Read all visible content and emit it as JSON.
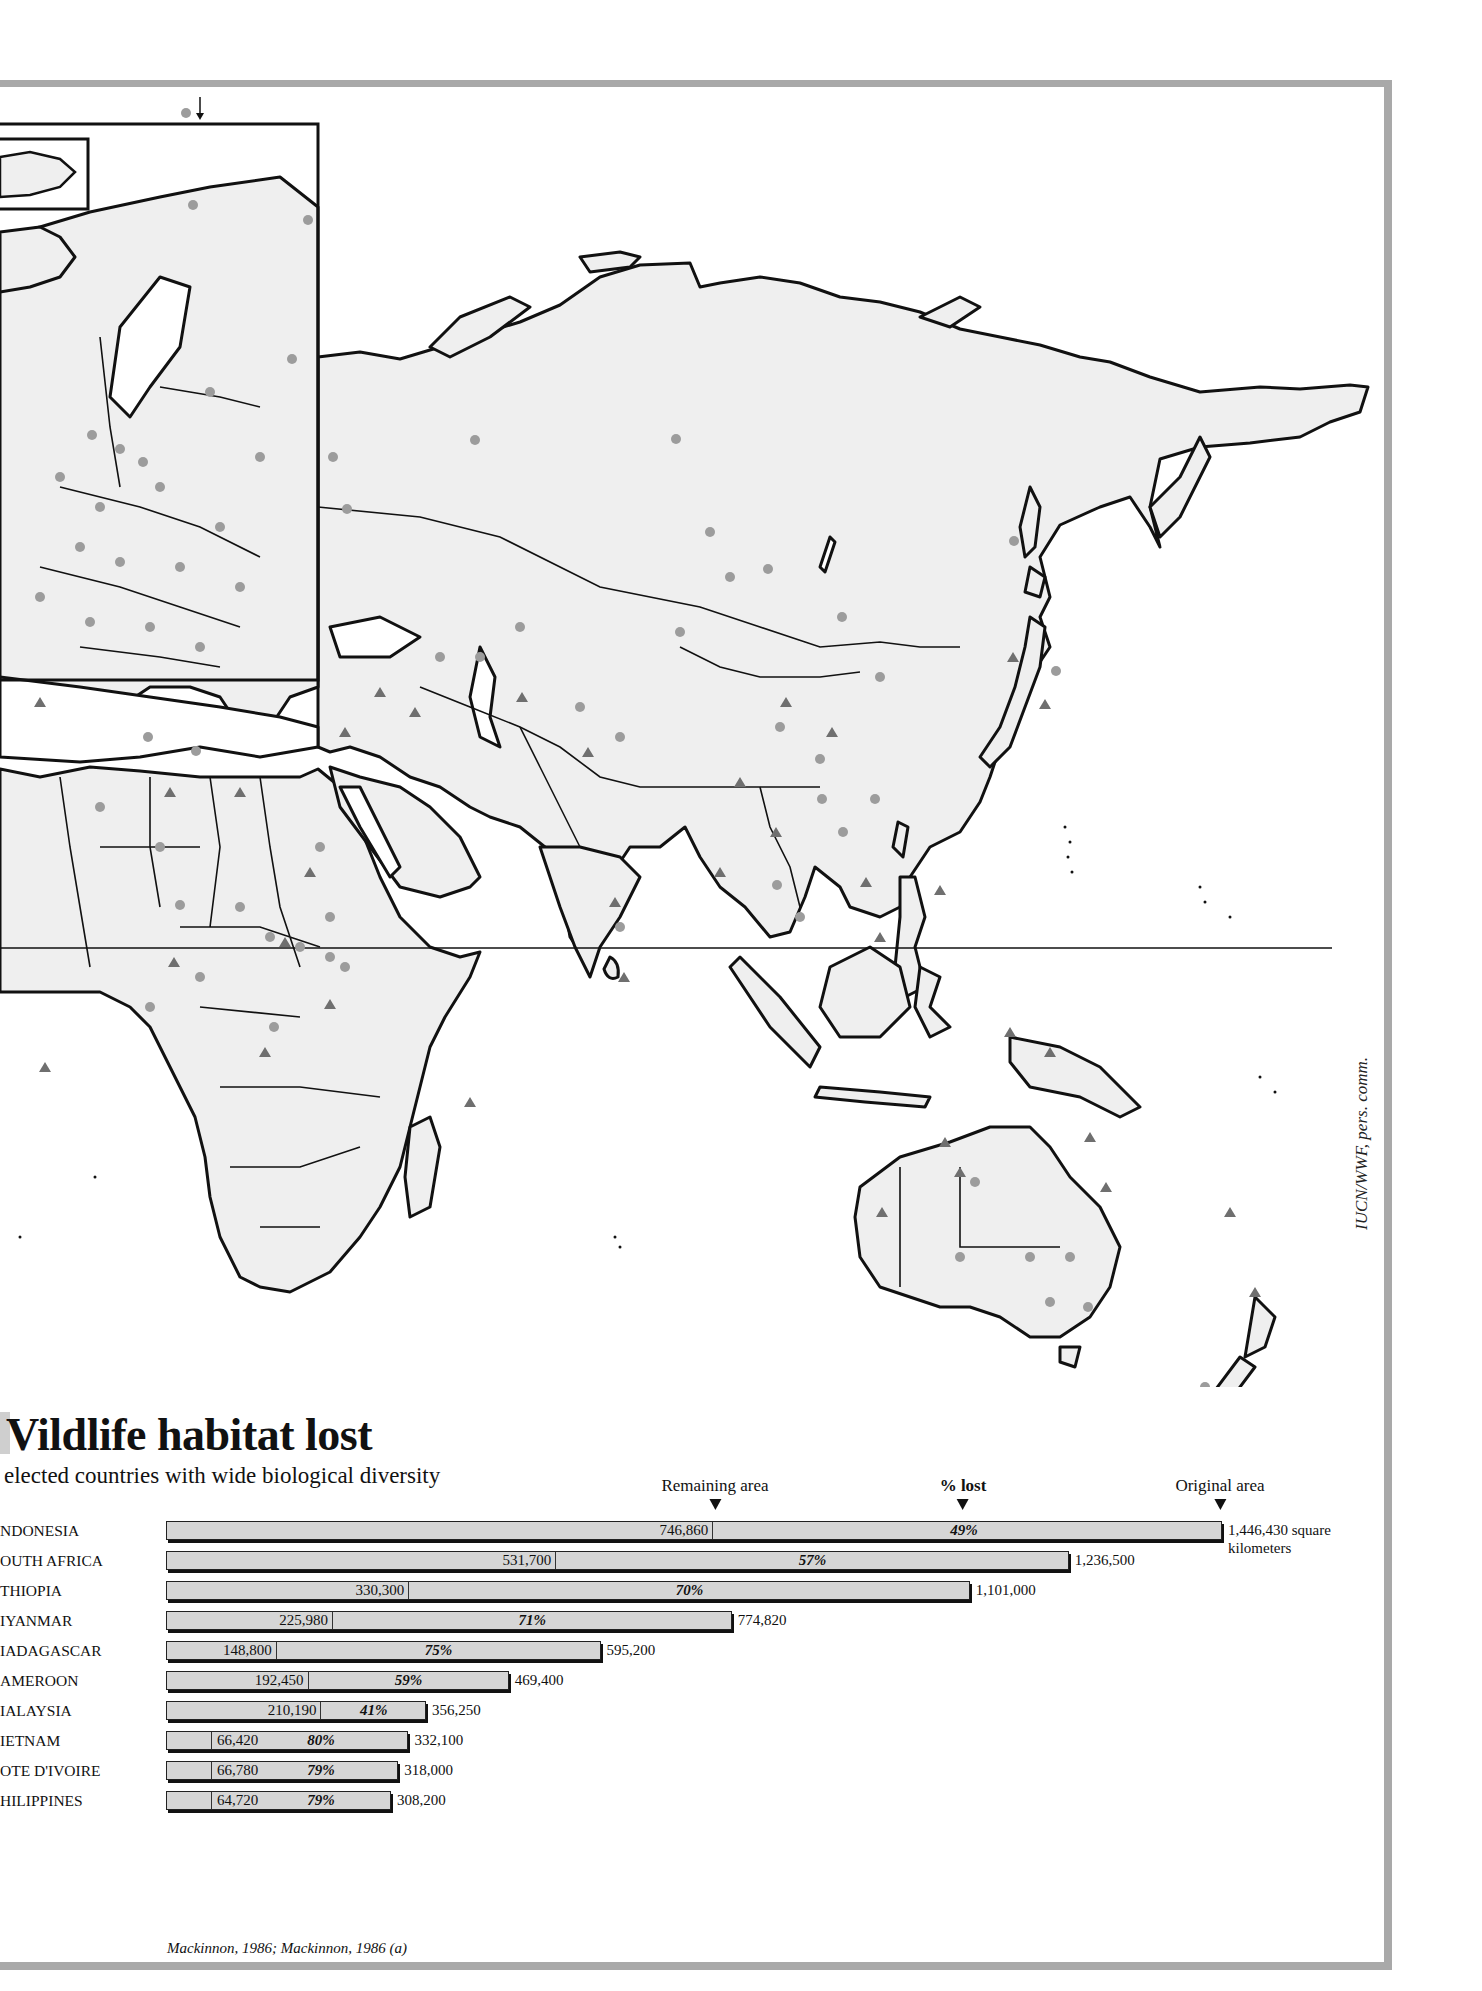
{
  "header": {
    "title_visible": "Vildlife habitat lost",
    "subtitle": "Selected countries with wide biological diversity",
    "subtitle_visible": "elected countries with wide biological diversity"
  },
  "legend_headers": {
    "remaining": "Remaining area",
    "pct_lost": "% lost",
    "original": "Original area"
  },
  "units": {
    "first_row_suffix": "square",
    "second_line": "kilometers"
  },
  "credit": "IUCN/WWF, pers. comm.",
  "source": "Mackinnon, 1986; Mackinnon, 1986 (a)",
  "map": {
    "land_color": "#efefef",
    "protected_area_circle_color": "#9c9c9c",
    "protected_area_triangle_color": "#6f6f6f",
    "frame_color": "#a9a9a9"
  },
  "chart_data": {
    "type": "bar",
    "orientation": "horizontal",
    "subtitle": "Selected countries with wide biological diversity",
    "xlabel": "square kilometers",
    "categories": [
      "INDONESIA",
      "SOUTH AFRICA",
      "ETHIOPIA",
      "MYANMAR",
      "MADAGASCAR",
      "CAMEROON",
      "MALAYSIA",
      "VIETNAM",
      "COTE D'IVOIRE",
      "PHILIPPINES"
    ],
    "visible_labels": [
      "NDONESIA",
      "OUTH AFRICA",
      "THIOPIA",
      "IYANMAR",
      "IADAGASCAR",
      "AMEROON",
      "IALAYSIA",
      "IETNAM",
      "OTE D'IVOIRE",
      "HILIPPINES"
    ],
    "series": [
      {
        "name": "Remaining area",
        "values": [
          746860,
          531700,
          330300,
          225980,
          148800,
          192450,
          210190,
          66420,
          66780,
          64720
        ],
        "labels": [
          "746,860",
          "531,700",
          "330,300",
          "225,980",
          "148,800",
          "192,450",
          "210,190",
          "66,420",
          "66,780",
          "64,720"
        ]
      },
      {
        "name": "Original area",
        "values": [
          1446430,
          1236500,
          1101000,
          774820,
          595200,
          469400,
          356250,
          332100,
          318000,
          308200
        ],
        "labels": [
          "1,446,430",
          "1,236,500",
          "1,101,000",
          "774,820",
          "595,200",
          "469,400",
          "356,250",
          "332,100",
          "318,000",
          "308,200"
        ]
      },
      {
        "name": "% lost",
        "values": [
          49,
          57,
          70,
          71,
          75,
          59,
          41,
          80,
          79,
          79
        ],
        "labels": [
          "49%",
          "57%",
          "70%",
          "71%",
          "75%",
          "59%",
          "41%",
          "80%",
          "79%",
          "79%"
        ]
      }
    ],
    "legend": [
      "Remaining area",
      "% lost",
      "Original area"
    ],
    "grid": false
  }
}
